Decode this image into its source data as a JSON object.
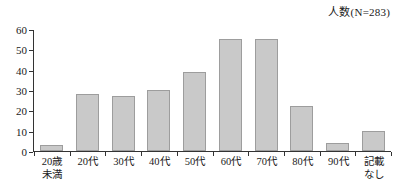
{
  "chart_data": {
    "type": "bar",
    "title": "人数(N=283)",
    "xlabel": "",
    "ylabel": "",
    "ylim": [
      0,
      60
    ],
    "yticks": [
      0,
      10,
      20,
      30,
      40,
      50,
      60
    ],
    "grid": false,
    "legend": "none",
    "categories": [
      "20歳\n未満",
      "20代",
      "30代",
      "40代",
      "50代",
      "60代",
      "70代",
      "80代",
      "90代",
      "記載\nなし"
    ],
    "values": [
      3,
      28,
      27,
      30,
      39,
      55,
      55,
      22,
      4,
      10
    ],
    "bar_color": "#c9c9c9",
    "bar_border_color": "#9d9d9d",
    "axis_color": "#333333",
    "total_label": "N=283"
  },
  "axis": {
    "y_tick_labels": [
      "60",
      "50",
      "40",
      "30",
      "20",
      "10",
      "0"
    ]
  }
}
